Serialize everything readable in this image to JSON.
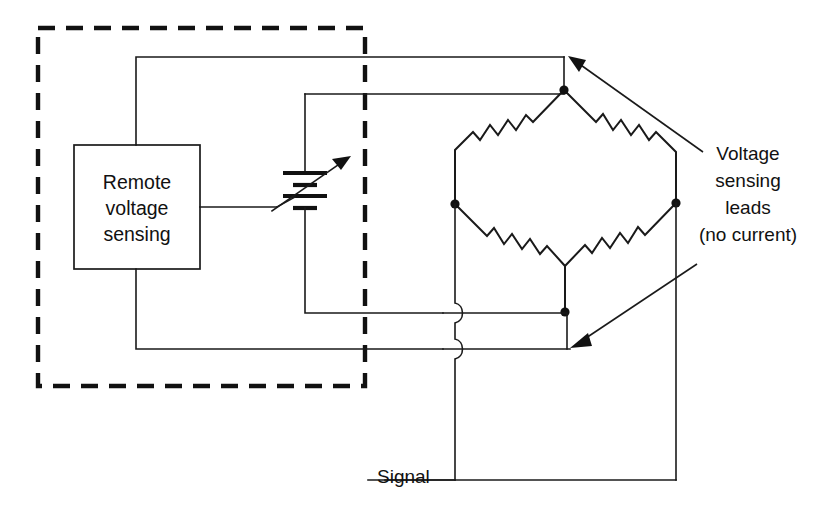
{
  "diagram": {
    "blocks": {
      "remote_sensing": {
        "line1": "Remote",
        "line2": "voltage",
        "line3": "sensing"
      }
    },
    "labels": {
      "signal": "Signal",
      "callout_line1": "Voltage",
      "callout_line2": "sensing",
      "callout_line3": "leads",
      "callout_line4": "(no current)"
    },
    "components": {
      "battery_name": "adjustable-voltage-source",
      "bridge_name": "wheatstone-bridge",
      "resistor_count": 4,
      "enclosure_name": "dashed-enclosure-boundary"
    },
    "colors": {
      "line": "#1a1a1a",
      "enclosure": "#111111",
      "background": "#ffffff"
    }
  }
}
